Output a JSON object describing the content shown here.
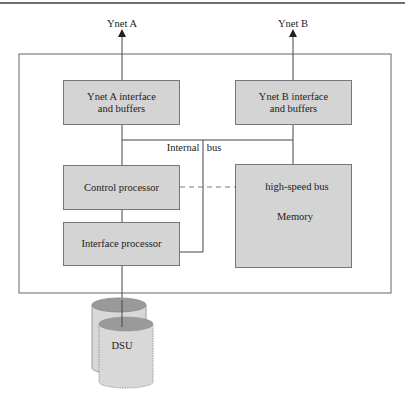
{
  "diagram": {
    "type": "block-diagram",
    "outputs": {
      "ynet_a": "Ynet A",
      "ynet_b": "Ynet B"
    },
    "blocks": {
      "ynet_a_interface": {
        "line1": "Ynet A interface",
        "line2": "and buffers"
      },
      "ynet_b_interface": {
        "line1": "Ynet B interface",
        "line2": "and buffers"
      },
      "control_processor": {
        "label": "Control processor"
      },
      "interface_processor": {
        "label": "Interface processor"
      },
      "memory": {
        "label": "Memory",
        "bus_label": "high-speed bus"
      }
    },
    "bus": {
      "internal_left": "Internal",
      "internal_right": "bus"
    },
    "storage": {
      "label": "DSU"
    },
    "colors": {
      "box_fill": "#d4d4d4",
      "line": "#555555",
      "cylinder_top": "#9a9a9a",
      "cylinder_body": "#d8d8d8"
    }
  }
}
